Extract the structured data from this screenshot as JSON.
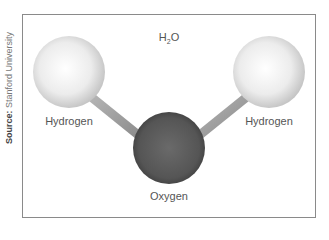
{
  "source": {
    "prefix": "Source:",
    "text": "Stanford University"
  },
  "diagram": {
    "title_main": "H",
    "title_sub": "2",
    "title_end": "O",
    "atoms": [
      {
        "label": "Hydrogen",
        "x": 69,
        "y": 72,
        "r": 36,
        "color": "#e6e6e6"
      },
      {
        "label": "Oxygen",
        "x": 169,
        "y": 148,
        "r": 36,
        "color": "#555555"
      },
      {
        "label": "Hydrogen",
        "x": 269,
        "y": 72,
        "r": 36,
        "color": "#e6e6e6"
      }
    ],
    "bond_color": "#9a9a9a"
  }
}
